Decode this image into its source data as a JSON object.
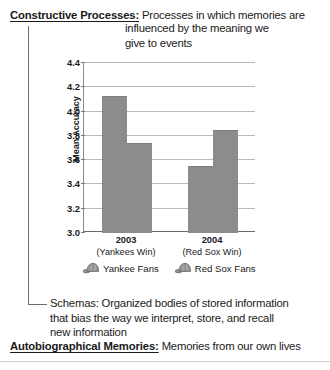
{
  "definitions": {
    "constructive": {
      "term": "Constructive Processes:",
      "line1": "Processes in which memories are",
      "line2": "influenced by the meaning we",
      "line3": "give to events"
    },
    "schemas": {
      "line1": "Schemas: Organized bodies of stored information",
      "line2": "that bias the way we interpret, store, and recall",
      "line3": "new information"
    },
    "autobiographical": {
      "term": "Autobiographical Memories:",
      "text": "Memories from our own lives"
    }
  },
  "chart_data": {
    "type": "bar",
    "title": "",
    "xlabel": "",
    "ylabel": "Mean Accuracy",
    "ylim": [
      3.0,
      4.4
    ],
    "ytick_step": 0.2,
    "yticks": [
      "4.4",
      "4.2",
      "4.0",
      "3.8",
      "3.6",
      "3.4",
      "3.2",
      "3.0"
    ],
    "grid": true,
    "legend_position": "below",
    "categories": [
      "2003",
      "2004"
    ],
    "category_sublabels": [
      "(Yankees Win)",
      "(Red Sox Win)"
    ],
    "series": [
      {
        "name": "Yankee Fans",
        "values": [
          4.12,
          3.54
        ],
        "color": "#8c8c8c",
        "icon": "baseball-cap-icon"
      },
      {
        "name": "Red Sox Fans",
        "values": [
          3.73,
          3.84
        ],
        "color": "#8c8c8c",
        "icon": "baseball-cap-icon"
      }
    ]
  }
}
